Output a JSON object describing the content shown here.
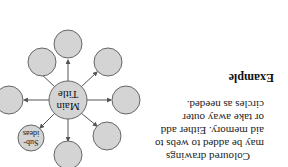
{
  "heading": "Example",
  "body_lines": [
    "Coloured drawings",
    "may be added to webs to",
    "aid memory. Either add",
    "or take away outer",
    "circles as needed."
  ],
  "diagram": {
    "center_label_line1": "Main",
    "center_label_line2": "Title",
    "sub_label_line1": "Sub-",
    "sub_label_line2": "ideas",
    "circle_fill": "#d4d4d4",
    "stroke": "#555555"
  }
}
